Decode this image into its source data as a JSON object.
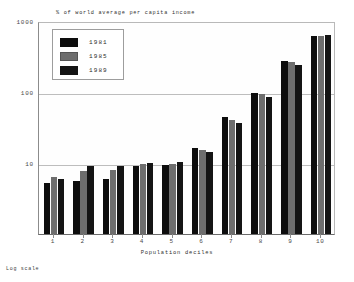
{
  "chart_data": {
    "type": "bar",
    "title": "% of world average per capita income",
    "xlabel": "Population deciles",
    "ylabel": "",
    "footnote": "Log scale",
    "scale": "log",
    "ylim": [
      1,
      1000
    ],
    "ytick_labels": [
      "1000",
      "100",
      "10"
    ],
    "ytick_values": [
      1000,
      100,
      10
    ],
    "grid": true,
    "legend_position": "top-left",
    "categories": [
      "1",
      "2",
      "3",
      "4",
      "5",
      "6",
      "7",
      "8",
      "9",
      "10"
    ],
    "series": [
      {
        "name": "1981",
        "color": "#0d0d0d",
        "values": [
          5.2,
          5.5,
          5.9,
          9.2,
          9.4,
          16.5,
          45.0,
          97.0,
          270.0,
          610.0
        ]
      },
      {
        "name": "1985",
        "color": "#6e6e6e",
        "values": [
          6.3,
          7.6,
          7.9,
          9.7,
          9.8,
          15.3,
          41.0,
          93.0,
          265.0,
          620.0
        ]
      },
      {
        "name": "1989",
        "color": "#141414",
        "values": [
          6.0,
          9.1,
          9.2,
          9.9,
          10.3,
          14.5,
          37.0,
          86.0,
          240.0,
          640.0
        ]
      }
    ]
  },
  "legend": {
    "entries": [
      {
        "label": "1981",
        "swatch": "black"
      },
      {
        "label": "1985",
        "swatch": "gray"
      },
      {
        "label": "1989",
        "swatch": "black"
      }
    ]
  },
  "colors": {
    "series_1981": "#0d0d0d",
    "series_1985": "#6e6e6e",
    "series_1989": "#141414",
    "gridline": "#bdbdbd",
    "axis": "#6a6a6a",
    "background": "#ffffff"
  }
}
